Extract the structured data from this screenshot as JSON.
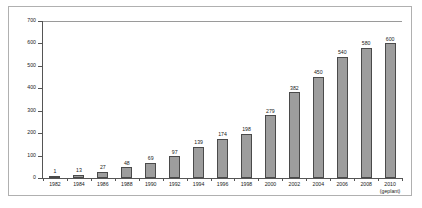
{
  "chart_data": {
    "type": "bar",
    "title": "",
    "subtitle": "",
    "xlabel": "",
    "ylabel": "",
    "ylim": [
      0,
      700
    ],
    "ytick_step": 100,
    "yticks": [
      "0",
      "100",
      "200",
      "300",
      "400",
      "500",
      "600",
      "700"
    ],
    "grid": false,
    "legend": "none",
    "categories": [
      "1982",
      "1984",
      "1986",
      "1988",
      "1990",
      "1992",
      "1994",
      "1996",
      "1998",
      "2000",
      "2002",
      "2004",
      "2006",
      "2008",
      "2010"
    ],
    "category_sublabels": [
      "",
      "",
      "",
      "",
      "",
      "",
      "",
      "",
      "",
      "",
      "",
      "",
      "",
      "",
      "(geplant)"
    ],
    "values": [
      1,
      13,
      27,
      48,
      69,
      97,
      139,
      174,
      198,
      279,
      382,
      450,
      540,
      580,
      600
    ],
    "data_labels": [
      "1",
      "13",
      "27",
      "48",
      "69",
      "97",
      "139",
      "174",
      "198",
      "279",
      "382",
      "450",
      "540",
      "580",
      "600"
    ],
    "series": [
      {
        "name": "",
        "values": [
          1,
          13,
          27,
          48,
          69,
          97,
          139,
          174,
          198,
          279,
          382,
          450,
          540,
          580,
          600
        ]
      }
    ]
  },
  "style": {
    "bar_fill": "#9d9d9d",
    "bar_stroke": "#4a4a4a",
    "axis_color": "#555555",
    "frame_color": "#b0b0b0",
    "text_color": "#1a1a1a",
    "background": "#ffffff"
  }
}
